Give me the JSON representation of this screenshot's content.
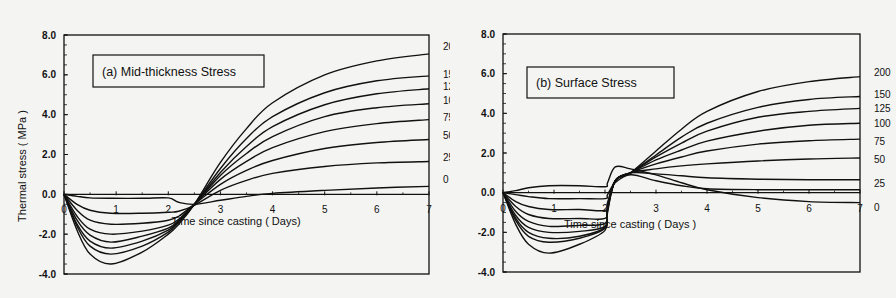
{
  "chart_data": [
    {
      "type": "line",
      "title": "(a)  Mid-thickness Stress",
      "xlabel": "Time since casting ( Days)",
      "ylabel": "Thermal stress ( MPa )",
      "xlim": [
        0,
        7
      ],
      "ylim": [
        -4.0,
        8.0
      ],
      "xticks": [
        "0",
        "1",
        "2",
        "3",
        "4",
        "5",
        "6",
        "7"
      ],
      "yticks": [
        "8.0",
        "6.0",
        "4.0",
        "2.0",
        "0.0",
        "-2.0",
        "-4.0"
      ],
      "grid": false,
      "legend_position": "curve labels at right edge",
      "x": [
        0,
        0.25,
        0.5,
        0.9,
        1.5,
        2.0,
        2.2,
        2.5,
        3.0,
        3.5,
        4.0,
        5.0,
        6.0,
        7.0
      ],
      "series": [
        {
          "name": "200",
          "values": [
            0,
            -1.8,
            -3.0,
            -3.5,
            -2.9,
            -2.0,
            -1.5,
            -0.5,
            1.6,
            3.3,
            4.6,
            6.0,
            6.7,
            7.05
          ]
        },
        {
          "name": "150",
          "values": [
            0,
            -1.6,
            -2.6,
            -3.0,
            -2.6,
            -1.9,
            -1.4,
            -0.5,
            1.3,
            2.8,
            3.9,
            5.1,
            5.7,
            5.95
          ]
        },
        {
          "name": "125",
          "values": [
            0,
            -1.5,
            -2.35,
            -2.7,
            -2.35,
            -1.8,
            -1.35,
            -0.5,
            1.1,
            2.4,
            3.4,
            4.5,
            5.05,
            5.3
          ]
        },
        {
          "name": "100",
          "values": [
            0,
            -1.3,
            -2.05,
            -2.4,
            -2.1,
            -1.7,
            -1.3,
            -0.5,
            0.95,
            2.05,
            2.9,
            3.9,
            4.35,
            4.55
          ]
        },
        {
          "name": "75",
          "values": [
            0,
            -1.1,
            -1.75,
            -2.0,
            -1.85,
            -1.55,
            -1.25,
            -0.5,
            0.75,
            1.65,
            2.35,
            3.15,
            3.55,
            3.75
          ]
        },
        {
          "name": "50",
          "values": [
            0,
            -0.8,
            -1.3,
            -1.5,
            -1.45,
            -1.3,
            -1.1,
            -0.5,
            0.5,
            1.2,
            1.7,
            2.3,
            2.6,
            2.75
          ]
        },
        {
          "name": "25",
          "values": [
            0,
            -0.5,
            -0.8,
            -0.95,
            -0.95,
            -0.9,
            -0.85,
            -0.55,
            0.2,
            0.7,
            1.05,
            1.4,
            1.58,
            1.65
          ]
        },
        {
          "name": "0",
          "values": [
            0,
            -0.1,
            -0.18,
            -0.2,
            -0.2,
            -0.18,
            -0.4,
            -0.5,
            -0.3,
            -0.1,
            0.05,
            0.2,
            0.32,
            0.4
          ]
        }
      ]
    },
    {
      "type": "line",
      "title": "(b)  Surface  Stress",
      "xlabel": "Time since casting ( Days )",
      "ylabel": "Thermal stress ( MPa )",
      "xlim": [
        0,
        7
      ],
      "ylim": [
        -4.0,
        8.0
      ],
      "xticks": [
        "0",
        "1",
        "2",
        "3",
        "4",
        "5",
        "6",
        "7"
      ],
      "yticks": [
        "8.0",
        "6.0",
        "4.0",
        "2.0",
        "0.0",
        "-2.0",
        "-4.0"
      ],
      "grid": false,
      "legend_position": "curve labels at right edge",
      "x": [
        0,
        0.25,
        0.5,
        0.9,
        1.5,
        2.0,
        2.05,
        2.2,
        2.5,
        3.0,
        3.5,
        4.0,
        5.0,
        6.0,
        7.0
      ],
      "series": [
        {
          "name": "200",
          "values": [
            0,
            -1.6,
            -2.6,
            -3.05,
            -2.6,
            -1.9,
            -1.0,
            0.6,
            1.0,
            2.1,
            3.2,
            4.1,
            5.1,
            5.6,
            5.85
          ]
        },
        {
          "name": "150",
          "values": [
            0,
            -1.4,
            -2.2,
            -2.5,
            -2.3,
            -1.8,
            -0.9,
            0.6,
            1.0,
            1.9,
            2.8,
            3.5,
            4.3,
            4.7,
            4.85
          ]
        },
        {
          "name": "125",
          "values": [
            0,
            -1.3,
            -2.0,
            -2.3,
            -2.2,
            -1.75,
            -0.85,
            0.6,
            1.0,
            1.8,
            2.5,
            3.1,
            3.8,
            4.1,
            4.25
          ]
        },
        {
          "name": "100",
          "values": [
            0,
            -1.15,
            -1.75,
            -2.0,
            -1.95,
            -1.7,
            -0.8,
            0.6,
            1.0,
            1.65,
            2.15,
            2.6,
            3.1,
            3.4,
            3.5
          ]
        },
        {
          "name": "75",
          "values": [
            0,
            -0.95,
            -1.45,
            -1.7,
            -1.65,
            -1.55,
            -0.75,
            0.6,
            1.0,
            1.45,
            1.8,
            2.1,
            2.45,
            2.62,
            2.7
          ]
        },
        {
          "name": "50",
          "values": [
            0,
            -0.7,
            -1.1,
            -1.3,
            -1.3,
            -1.3,
            -0.7,
            0.6,
            1.0,
            1.2,
            1.35,
            1.45,
            1.6,
            1.7,
            1.75
          ]
        },
        {
          "name": "25",
          "values": [
            0,
            -0.45,
            -0.7,
            -0.85,
            -0.85,
            -0.9,
            -0.5,
            0.6,
            1.0,
            0.95,
            0.85,
            0.75,
            0.68,
            0.65,
            0.65
          ]
        },
        {
          "name": "0",
          "values": [
            0,
            0.1,
            0.25,
            0.35,
            0.35,
            0.3,
            0.5,
            1.3,
            1.2,
            0.9,
            0.5,
            0.15,
            -0.25,
            -0.45,
            -0.5
          ]
        },
        {
          "name": "",
          "values": [
            0,
            -0.1,
            -0.2,
            -0.3,
            -0.3,
            -0.3,
            -0.1,
            0.5,
            0.9,
            0.6,
            0.35,
            0.2,
            0.15,
            0.15,
            0.15
          ]
        }
      ]
    }
  ]
}
